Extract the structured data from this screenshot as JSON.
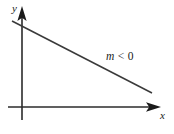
{
  "figure": {
    "type": "coordinate-plane-line-graph",
    "background_color": "#ffffff",
    "stroke_color": "#2b2b2b",
    "axes": {
      "x_axis": {
        "label": "x",
        "arrow": "right",
        "from": [
          8,
          107
        ],
        "to": [
          160,
          107
        ]
      },
      "y_axis": {
        "label": "y",
        "arrow": "up",
        "from": [
          22,
          120
        ],
        "to": [
          22,
          7
        ]
      }
    },
    "line": {
      "annotation_var": "m",
      "annotation_rel": "<",
      "annotation_num": "0",
      "annotation_full": "m < 0",
      "from": [
        12,
        21
      ],
      "to": [
        152,
        93
      ],
      "direction": "decreasing"
    }
  }
}
